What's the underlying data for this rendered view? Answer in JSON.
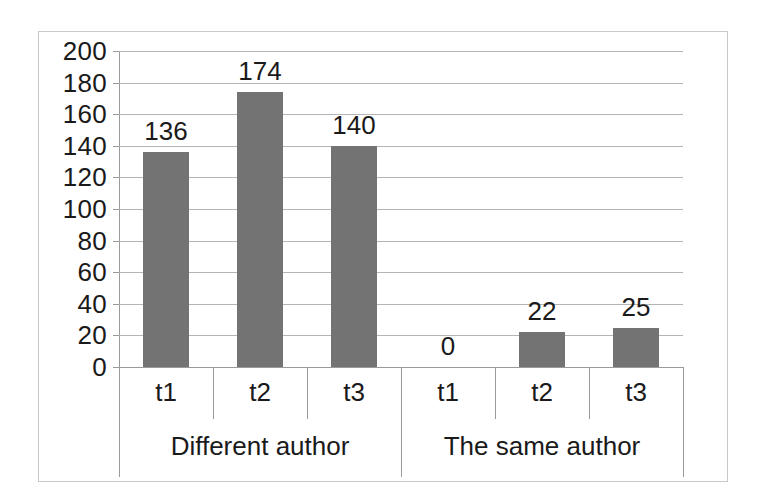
{
  "chart_data": {
    "type": "bar",
    "title": "",
    "subtitle": "",
    "xlabel": "",
    "ylabel": "",
    "ylim": [
      0,
      200
    ],
    "ytick_step": 20,
    "ytick_labels": [
      "200",
      "180",
      "160",
      "140",
      "120",
      "100",
      "80",
      "60",
      "40",
      "20",
      "0"
    ],
    "ytick_values": [
      200,
      180,
      160,
      140,
      120,
      100,
      80,
      60,
      40,
      20,
      0
    ],
    "grid": true,
    "legend": "none",
    "bar_color": "#737373",
    "groups": [
      {
        "label": "Different author",
        "categories": [
          "t1",
          "t2",
          "t3"
        ],
        "values": [
          136,
          174,
          140
        ],
        "value_labels": [
          "136",
          "174",
          "140"
        ]
      },
      {
        "label": "The same author",
        "categories": [
          "t1",
          "t2",
          "t3"
        ],
        "values": [
          0,
          22,
          25
        ],
        "value_labels": [
          "0",
          "22",
          "25"
        ]
      }
    ],
    "categories": [
      "t1",
      "t2",
      "t3",
      "t1",
      "t2",
      "t3"
    ],
    "values": [
      136,
      174,
      140,
      0,
      22,
      25
    ],
    "value_labels": [
      "136",
      "174",
      "140",
      "0",
      "22",
      "25"
    ]
  },
  "colors": {
    "bar": "#737373",
    "gridline": "#b4b4b4",
    "axis": "#9a9a9a",
    "border": "#c9c9c9",
    "text": "#1a1a1a",
    "background": "#ffffff"
  }
}
